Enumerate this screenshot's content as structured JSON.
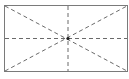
{
  "diagram": {
    "type": "rectangle-with-guides",
    "rect": {
      "x": 4.5,
      "y": 5.5,
      "w": 123,
      "h": 66
    },
    "center": {
      "x": 68,
      "y": 38.5
    },
    "colors": {
      "border": "#7a7a7a",
      "dash": "#6a6a6a",
      "center_dot": "#222222"
    }
  }
}
